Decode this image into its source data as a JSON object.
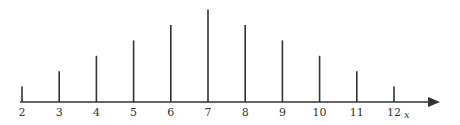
{
  "chart_data": {
    "type": "bar",
    "style": "stem",
    "title": "",
    "xlabel": "x",
    "ylabel": "",
    "categories": [
      "2",
      "3",
      "4",
      "5",
      "6",
      "7",
      "8",
      "9",
      "10",
      "11",
      "12"
    ],
    "values": [
      1,
      2,
      3,
      4,
      5,
      6,
      5,
      4,
      3,
      2,
      1
    ],
    "ylim": [
      0,
      6
    ],
    "grid": false,
    "legend": null,
    "colors": {
      "stem": "#333333",
      "axis": "#333333"
    }
  }
}
